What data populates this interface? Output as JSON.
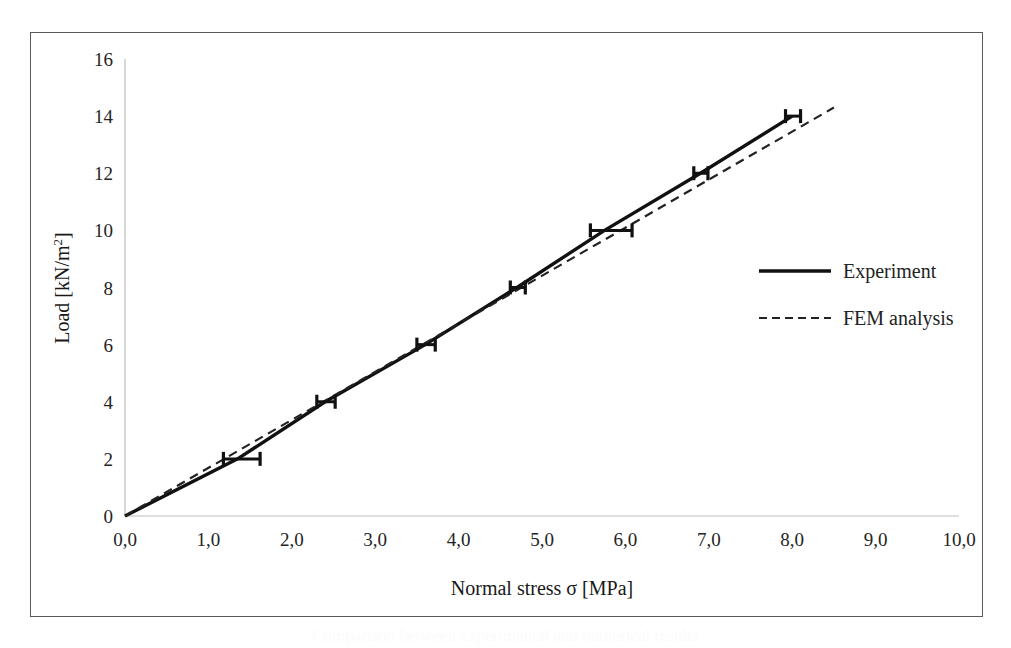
{
  "figure": {
    "caption_ghost": "Comparison between experimental and numerical results",
    "border_color": "#5a5a5a"
  },
  "chart_data": {
    "type": "line",
    "title": "",
    "xlabel": "Normal stress σ [MPa]",
    "ylabel": "Load [kN/m²]",
    "ylabel_base": "Load [kN/m",
    "ylabel_sup": "2",
    "ylabel_tail": "]",
    "xlim": [
      0,
      10
    ],
    "ylim": [
      0,
      16
    ],
    "grid": false,
    "legend_position": "right-middle",
    "xticks": [
      0,
      1,
      2,
      3,
      4,
      5,
      6,
      7,
      8,
      9,
      10
    ],
    "xtick_labels": [
      "0,0",
      "1,0",
      "2,0",
      "3,0",
      "4,0",
      "5,0",
      "6,0",
      "7,0",
      "8,0",
      "9,0",
      "10,0"
    ],
    "yticks": [
      0,
      2,
      4,
      6,
      8,
      10,
      12,
      14,
      16
    ],
    "ytick_labels": [
      "0",
      "2",
      "4",
      "6",
      "8",
      "10",
      "12",
      "14",
      "16"
    ],
    "series": [
      {
        "name": "Experiment",
        "style": "solid",
        "color": "#111111",
        "width": 3.4,
        "x": [
          0.0,
          1.35,
          2.4,
          3.6,
          4.7,
          5.75,
          6.9,
          8.0
        ],
        "y": [
          0,
          2,
          4,
          6,
          8,
          10,
          12,
          14
        ],
        "error_bars_x": [
          {
            "x": 1.35,
            "y": 2,
            "low": 1.18,
            "high": 1.62
          },
          {
            "x": 2.4,
            "y": 4,
            "low": 2.3,
            "high": 2.52
          },
          {
            "x": 3.6,
            "y": 6,
            "low": 3.5,
            "high": 3.72
          },
          {
            "x": 4.7,
            "y": 8,
            "low": 4.62,
            "high": 4.8
          },
          {
            "x": 5.75,
            "y": 10,
            "low": 5.58,
            "high": 6.08
          },
          {
            "x": 6.9,
            "y": 12,
            "low": 6.82,
            "high": 6.99
          },
          {
            "x": 8.0,
            "y": 14,
            "low": 7.92,
            "high": 8.1
          }
        ]
      },
      {
        "name": "FEM analysis",
        "style": "dashed",
        "color": "#222222",
        "width": 2.2,
        "x": [
          0.0,
          8.5
        ],
        "y": [
          0,
          14.3
        ]
      }
    ],
    "legend": [
      {
        "label": "Experiment",
        "style": "solid"
      },
      {
        "label": "FEM analysis",
        "style": "dashed"
      }
    ]
  }
}
